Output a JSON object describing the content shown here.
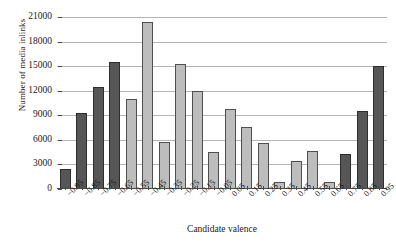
{
  "chart_data": {
    "type": "bar",
    "title": "",
    "xlabel": "Candidate valence",
    "ylabel": "Number of media inlinks",
    "categories": [
      "−0.95",
      "−0.85",
      "−0.75",
      "−0.65",
      "−0.55",
      "−0.45",
      "−0.35",
      "−0.25",
      "−0.15",
      "−0.05",
      "0.05",
      "0.15",
      "0.25",
      "0.35",
      "0.45",
      "0.55",
      "0.65",
      "0.75",
      "0.85",
      "0.95"
    ],
    "values": [
      2500,
      9300,
      12500,
      15500,
      11000,
      20400,
      5800,
      15300,
      12000,
      4500,
      9800,
      7600,
      5600,
      800,
      3400,
      4600,
      900,
      4300,
      9500,
      15000
    ],
    "bar_shades": [
      "dark",
      "dark",
      "dark",
      "dark",
      "light",
      "light",
      "light",
      "light",
      "light",
      "light",
      "light",
      "light",
      "light",
      "light",
      "light",
      "light",
      "light",
      "dark",
      "dark",
      "dark"
    ],
    "ylim": [
      0,
      21000
    ],
    "yticks": [
      0,
      3000,
      6000,
      9000,
      12000,
      15000,
      18000,
      21000
    ],
    "ytick_labels": [
      "0",
      "3000",
      "6000",
      "9000",
      "12000",
      "15000",
      "18000",
      "21000"
    ],
    "grid": true,
    "legend": "none",
    "colors": {
      "bar_dark": "#565656",
      "bar_light": "#bdbdbd",
      "gridline": "#b4b4b4",
      "axis": "#4a4a4a",
      "text": "#1a1a1a",
      "background": "#ffffff"
    }
  }
}
